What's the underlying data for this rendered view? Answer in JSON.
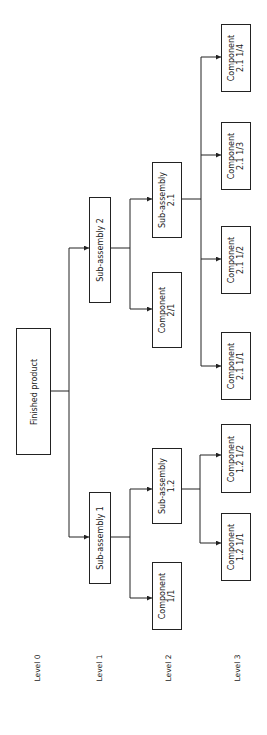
{
  "levels": [
    "Level 0",
    "Level 1",
    "Level 2",
    "Level 3"
  ],
  "nodes": {
    "finished": {
      "l1": "Finished product",
      "l2": ""
    },
    "sa1": {
      "l1": "Sub-assembly 1",
      "l2": ""
    },
    "sa2": {
      "l1": "Sub-assembly 2",
      "l2": ""
    },
    "c11": {
      "l1": "Component",
      "l2": "1/1"
    },
    "sa12": {
      "l1": "Sub-assembly",
      "l2": "1.2"
    },
    "c21": {
      "l1": "Component",
      "l2": "2/1"
    },
    "sa21": {
      "l1": "Sub-assembly",
      "l2": "2.1"
    },
    "c1211": {
      "l1": "Component",
      "l2": "1.2 1/1"
    },
    "c1212": {
      "l1": "Component",
      "l2": "1.2 1/2"
    },
    "c2111": {
      "l1": "Component",
      "l2": "2.1 1/1"
    },
    "c2112": {
      "l1": "Component",
      "l2": "2.1 1/2"
    },
    "c2113": {
      "l1": "Component",
      "l2": "2.1 1/3"
    },
    "c2114": {
      "l1": "Component",
      "l2": "2.1 1/4"
    }
  },
  "colors": {
    "line": "#222222",
    "background": "#ffffff"
  }
}
